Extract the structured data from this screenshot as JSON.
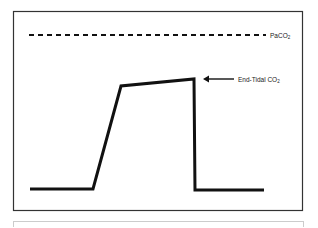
{
  "diagram": {
    "labels": {
      "paco2_main": "PaCO",
      "paco2_sub": "2",
      "etco2_main": "End-Tidal CO",
      "etco2_sub": "2"
    },
    "colors": {
      "line": "#111111",
      "frame": "#333333",
      "lower_panel_border": "#cccccc",
      "background": "#ffffff"
    },
    "waveform_points": [
      [
        30,
        189
      ],
      [
        93,
        189
      ],
      [
        121,
        86
      ],
      [
        194,
        79
      ],
      [
        195,
        190
      ],
      [
        264,
        190
      ]
    ],
    "paco2_line": {
      "x1": 29,
      "x2": 266,
      "y": 35,
      "dash": "5 4"
    },
    "arrow": {
      "x_tip": 203,
      "x_tail": 234,
      "y": 79
    }
  }
}
